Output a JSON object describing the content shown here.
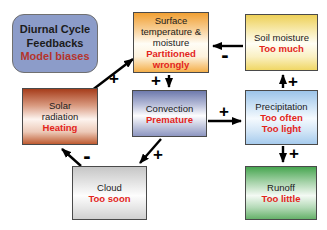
{
  "diagram": {
    "kind": "feedback-loop-diagram",
    "colors": {
      "background": "#ffffff",
      "text_black": "#1b1b1b",
      "bias_red": "#e3251c",
      "title_bias_red": "#b5342c",
      "arrow_black": "#000000",
      "title_fill": "#8c9cc9"
    }
  },
  "nodes": {
    "title": {
      "l1": "Diurnal Cycle",
      "l2": "Feedbacks",
      "bias1": "Model biases",
      "fill": "#8c9cc9"
    },
    "surface": {
      "l1": "Surface",
      "l2": "temperature &",
      "l3": "moisture",
      "bias1": "Partitioned",
      "bias2": "wrongly",
      "color_top": "#f1a033",
      "color_bottom": "#f4af4a"
    },
    "soil": {
      "l1": "Soil moisture",
      "bias1": "Too much",
      "color_top": "#edd058",
      "color_bottom": "#f0d765"
    },
    "solar": {
      "l1": "Solar",
      "l2": "radiation",
      "bias1": "Heating",
      "color_top": "#a63d1b",
      "color_bottom": "#bf5b31"
    },
    "convection": {
      "l1": "Convection",
      "bias1": "Premature",
      "color_top": "#6e7aad",
      "color_bottom": "#8d96c1"
    },
    "precipitation": {
      "l1": "Precipitation",
      "bias1": "Too often",
      "bias2": "Too light",
      "color_top": "#9cc4e9",
      "color_bottom": "#a6cbed"
    },
    "cloud": {
      "l1": "Cloud",
      "bias1": "Too soon",
      "color_top": "#c6c6c6",
      "color_bottom": "#d0d0d0"
    },
    "runoff": {
      "l1": "Runoff",
      "bias1": "Too little",
      "color_top": "#47a650",
      "color_bottom": "#66b26a"
    }
  },
  "edges": [
    {
      "from": "solar",
      "to": "surface",
      "sign": "+"
    },
    {
      "from": "soil",
      "to": "surface",
      "sign": "-"
    },
    {
      "from": "surface",
      "to": "convection",
      "sign": "+"
    },
    {
      "from": "convection",
      "to": "precipitation",
      "sign": "+"
    },
    {
      "from": "precipitation",
      "to": "soil",
      "sign": "+"
    },
    {
      "from": "precipitation",
      "to": "runoff",
      "sign": "+"
    },
    {
      "from": "convection",
      "to": "cloud",
      "sign": "+"
    },
    {
      "from": "cloud",
      "to": "solar",
      "sign": "-"
    }
  ]
}
